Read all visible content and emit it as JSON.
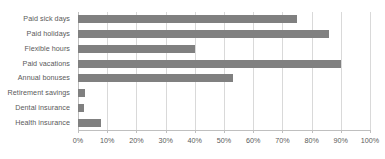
{
  "chart_data": {
    "type": "bar",
    "orientation": "horizontal",
    "title": "",
    "xlabel": "",
    "ylabel": "",
    "categories": [
      "Paid sick days",
      "Paid holidays",
      "Flexible hours",
      "Paid vacations",
      "Annual bonuses",
      "Retirement savings",
      "Dental insurance",
      "Health insurance"
    ],
    "values": [
      75,
      86,
      40,
      90,
      53,
      2.5,
      2,
      8
    ],
    "value_format": "percent",
    "xlim": [
      0,
      100
    ],
    "xticks": [
      0,
      10,
      20,
      30,
      40,
      50,
      60,
      70,
      80,
      90,
      100
    ],
    "xticklabels": [
      "0%",
      "10%",
      "20%",
      "30%",
      "40%",
      "50%",
      "60%",
      "70%",
      "80%",
      "90%",
      "100%"
    ],
    "grid": "vertical",
    "legend": "none",
    "bar_color": "#808080",
    "gridline_color": "#d9d9d9",
    "axis_color": "#bfbfbf",
    "text_color": "#5a5a5a"
  }
}
